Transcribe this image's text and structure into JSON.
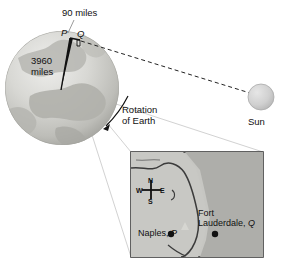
{
  "figure": {
    "labels": {
      "arc_distance": "90 miles",
      "radius": "3960\nmiles",
      "rotation": "Rotation\nof Earth",
      "sun": "Sun",
      "point_p": "P",
      "point_q": "Q"
    },
    "inset_map": {
      "compass": {
        "north": "N",
        "south": "S",
        "east": "E",
        "west": "W"
      },
      "cities": [
        {
          "name": "Naples, ",
          "point": "P"
        },
        {
          "name": "Fort\nLauderdale, ",
          "point": "Q"
        }
      ],
      "city_naples_name": "Naples, ",
      "city_naples_point": "P",
      "city_fort_name_line1": "Fort",
      "city_fort_name_line2": "Lauderdale, ",
      "city_fort_point": "Q"
    },
    "colors": {
      "globe_light": "#e2e2e0",
      "globe_mid": "#c9c9c6",
      "globe_dark": "#a8a8a4",
      "sun_fill": "#cfcfcf",
      "map_land": "#c4c4c0",
      "map_water": "#aeaeaa",
      "map_border": "#3a3a3a",
      "ink": "#111111",
      "leader": "#cccccc"
    }
  }
}
